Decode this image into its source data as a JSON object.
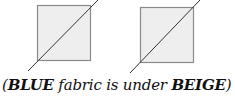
{
  "diagram": {
    "squares": [
      {
        "id": "left",
        "x": 37,
        "y": 5,
        "size": 54,
        "line": {
          "x1": 28,
          "y1": 71,
          "x2": 98,
          "y2": 0
        }
      },
      {
        "id": "right",
        "x": 140,
        "y": 7,
        "size": 54,
        "line": {
          "x1": 130,
          "y1": 73,
          "x2": 200,
          "y2": 0
        }
      }
    ],
    "colors": {
      "fill": "#eeeeee",
      "border": "#8a8a8a",
      "line": "#333333"
    }
  },
  "caption": {
    "open": "(",
    "word1": "BLUE",
    "middle": " fabric is under ",
    "word2": "BEIGE",
    "close": ")"
  }
}
